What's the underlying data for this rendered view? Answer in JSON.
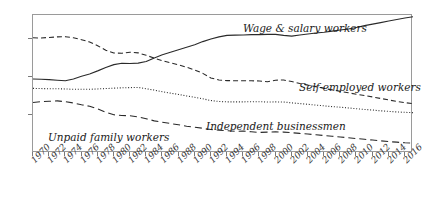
{
  "chart_data": {
    "type": "line",
    "title": "",
    "xlabel": "",
    "ylabel": "",
    "xlim": [
      1970,
      2017
    ],
    "ylim": [
      0,
      72.6
    ],
    "grid": false,
    "legend_position": "inline-annotations",
    "yticks": [
      "20.0",
      "40.0",
      "60.0"
    ],
    "ytick_values": [
      20.0,
      40.0,
      60.0
    ],
    "x": [
      1970,
      1971,
      1972,
      1973,
      1974,
      1975,
      1976,
      1977,
      1978,
      1979,
      1980,
      1981,
      1982,
      1983,
      1984,
      1985,
      1986,
      1987,
      1988,
      1989,
      1990,
      1991,
      1992,
      1993,
      1994,
      1995,
      1996,
      1997,
      1998,
      1999,
      2000,
      2001,
      2002,
      2003,
      2004,
      2005,
      2006,
      2007,
      2008,
      2009,
      2010,
      2011,
      2012,
      2013,
      2014,
      2015,
      2016,
      2017
    ],
    "xtick_labels": [
      "1970",
      "1972",
      "1974",
      "1976",
      "1978",
      "1980",
      "1982",
      "1984",
      "1986",
      "1988",
      "1990",
      "1992",
      "1994",
      "1996",
      "1998",
      "2000",
      "2002",
      "2004",
      "2006",
      "2008",
      "2010",
      "2012",
      "2014",
      "2016"
    ],
    "series": [
      {
        "name": "Wage & salary workers",
        "style": "solid",
        "label_x": 243,
        "label_y": 22,
        "values": [
          38.9,
          38.8,
          38.6,
          38.3,
          38.0,
          38.9,
          40.4,
          41.6,
          43.2,
          45.0,
          46.5,
          47.2,
          47.1,
          47.3,
          48.1,
          50.0,
          51.7,
          53.0,
          54.3,
          55.6,
          56.9,
          58.6,
          60.0,
          61.1,
          61.9,
          62.0,
          62.1,
          62.3,
          62.3,
          62.4,
          62.4,
          61.9,
          61.5,
          62.1,
          62.6,
          63.1,
          63.5,
          64.1,
          64.7,
          65.2,
          66.0,
          67.0,
          67.8,
          68.6,
          69.4,
          70.2,
          71.0,
          71.7
        ]
      },
      {
        "name": "Self-employed workers",
        "style": "dashed",
        "label_x": 299,
        "label_y": 81,
        "values": [
          60.6,
          60.5,
          60.8,
          61.1,
          61.2,
          60.6,
          59.6,
          58.4,
          56.4,
          54.1,
          52.6,
          52.5,
          53.0,
          52.7,
          51.4,
          49.9,
          48.5,
          47.5,
          46.4,
          45.1,
          43.7,
          41.9,
          39.5,
          38.4,
          38.1,
          38.0,
          38.0,
          38.0,
          37.9,
          37.5,
          38.3,
          38.4,
          37.6,
          36.6,
          35.7,
          34.9,
          34.0,
          33.2,
          32.4,
          31.7,
          30.9,
          30.2,
          29.5,
          28.7,
          27.9,
          27.1,
          26.5,
          26.0
        ]
      },
      {
        "name": "Independent businessmen",
        "style": "dotted",
        "label_x": 206,
        "label_y": 120,
        "values": [
          34.0,
          33.9,
          33.8,
          33.8,
          33.7,
          33.5,
          33.5,
          33.5,
          33.7,
          33.9,
          34.1,
          34.3,
          34.4,
          34.5,
          33.8,
          33.1,
          32.2,
          31.5,
          30.8,
          30.0,
          29.3,
          28.5,
          27.6,
          27.1,
          26.9,
          26.9,
          26.9,
          27.0,
          27.0,
          26.8,
          26.9,
          26.8,
          26.4,
          26.0,
          25.6,
          25.2,
          24.8,
          24.4,
          24.1,
          23.7,
          23.3,
          22.9,
          22.6,
          22.2,
          21.9,
          21.6,
          21.4,
          21.2
        ]
      },
      {
        "name": "Unpaid family workers",
        "style": "longdash",
        "label_x": 48,
        "label_y": 131,
        "values": [
          26.6,
          27.0,
          27.2,
          27.4,
          27.0,
          26.3,
          25.4,
          24.6,
          23.2,
          21.4,
          20.1,
          19.7,
          19.6,
          19.0,
          18.0,
          16.9,
          16.2,
          15.5,
          14.9,
          14.1,
          13.6,
          13.0,
          12.4,
          12.0,
          11.7,
          11.4,
          11.5,
          11.2,
          10.8,
          11.0,
          11.1,
          11.0,
          10.7,
          10.3,
          10.0,
          9.6,
          9.2,
          8.8,
          8.4,
          8.0,
          7.6,
          7.2,
          6.8,
          6.4,
          6.0,
          5.7,
          5.4,
          5.2
        ]
      }
    ]
  },
  "colors": {
    "line": "#2a2a2a",
    "frame": "#9a9a9a",
    "text": "#1a1a1a",
    "tick": "#7a7a7a"
  }
}
